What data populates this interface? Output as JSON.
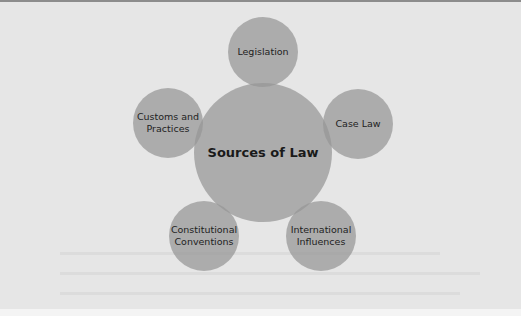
{
  "diagram": {
    "type": "hub-and-spoke",
    "center": {
      "label": "Sources of Law"
    },
    "nodes": [
      {
        "id": "legislation",
        "label": "Legislation"
      },
      {
        "id": "case-law",
        "label": "Case Law"
      },
      {
        "id": "international-influences",
        "label": "International Influences"
      },
      {
        "id": "constitutional-conventions",
        "label": "Constitutional Conventions"
      },
      {
        "id": "customs-and-practices",
        "label": "Customs and Practices"
      }
    ],
    "colors": {
      "background": "#e6e6e6",
      "circle_fill": "#a8a8a8",
      "text": "#222222",
      "top_rule": "#8c8c8c"
    }
  }
}
